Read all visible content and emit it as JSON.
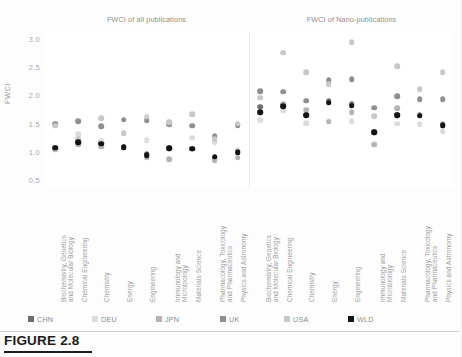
{
  "figure": {
    "caption": "FIGURE 2.8",
    "axis_title": "FWCI"
  },
  "panels": [
    {
      "id": "all",
      "title": "FWCI of all publications"
    },
    {
      "id": "nano",
      "title": "FWCI of Nano-publications"
    }
  ],
  "legend": {
    "items": [
      {
        "label": "CHN",
        "color": "#6e6e6e"
      },
      {
        "label": "DEU",
        "color": "#dcdcdc"
      },
      {
        "label": "JPN",
        "color": "#b4b4b4"
      },
      {
        "label": "UK",
        "color": "#8f8f8f"
      },
      {
        "label": "USA",
        "color": "#c8c8c8"
      },
      {
        "label": "WLD",
        "color": "#141414"
      }
    ]
  },
  "chart_data": {
    "type": "scatter",
    "xlabel": "",
    "ylabel": "FWCI",
    "ylim": [
      0.35,
      3.15
    ],
    "yticks": [
      "0.5",
      "1.0",
      "1.5",
      "2.0",
      "2.5",
      "3.0"
    ],
    "ytick_values": [
      0.5,
      1.0,
      1.5,
      2.0,
      2.5,
      3.0
    ],
    "grid": false,
    "legend_position": "bottom",
    "categories": [
      "Biochemistry, Genetics\nand Molecular Biology",
      "Chemical Engineering",
      "Chemistry",
      "Energy",
      "Engineering",
      "Immunology and\nMicrobiology",
      "Materials Science",
      "Pharmacology, Toxicology\nand Pharmaceutics",
      "Physics and Astronomy"
    ],
    "panels": [
      {
        "name": "FWCI of all publications",
        "series": [
          {
            "name": "CHN",
            "color": "#6e6e6e",
            "values": [
              1.06,
              1.17,
              1.15,
              1.08,
              0.95,
              1.06,
              1.05,
              0.88,
              0.99
            ]
          },
          {
            "name": "DEU",
            "color": "#dcdcdc",
            "values": [
              1.48,
              1.31,
              1.19,
              1.33,
              1.2,
              1.52,
              1.25,
              1.17,
              1.02
            ]
          },
          {
            "name": "JPN",
            "color": "#b4b4b4",
            "values": [
              1.04,
              1.13,
              1.09,
              1.08,
              0.89,
              0.86,
              1.05,
              0.85,
              0.89
            ]
          },
          {
            "name": "UK",
            "color": "#8f8f8f",
            "values": [
              1.5,
              1.54,
              1.45,
              1.57,
              1.56,
              1.49,
              1.46,
              1.27,
              1.47
            ]
          },
          {
            "name": "USA",
            "color": "#c8c8c8",
            "values": [
              1.46,
              1.22,
              1.59,
              1.33,
              1.62,
              1.52,
              1.67,
              1.22,
              1.5
            ]
          },
          {
            "name": "WLD",
            "color": "#141414",
            "values": [
              1.07,
              1.17,
              1.14,
              1.08,
              0.94,
              1.06,
              1.05,
              0.91,
              0.99
            ]
          }
        ]
      },
      {
        "name": "FWCI of Nano-publications",
        "series": [
          {
            "name": "CHN",
            "color": "#6e6e6e",
            "values": [
              1.8,
              1.82,
              1.66,
              1.9,
              1.84,
              1.35,
              1.66,
              1.66,
              1.46
            ]
          },
          {
            "name": "DEU",
            "color": "#dcdcdc",
            "values": [
              1.56,
              1.74,
              1.51,
              1.55,
              1.54,
              1.14,
              1.5,
              1.49,
              1.36
            ]
          },
          {
            "name": "JPN",
            "color": "#b4b4b4",
            "values": [
              1.7,
              1.85,
              1.75,
              1.53,
              1.7,
              1.12,
              1.77,
              1.64,
              1.5
            ]
          },
          {
            "name": "UK",
            "color": "#8f8f8f",
            "values": [
              2.08,
              2.07,
              1.91,
              2.27,
              2.29,
              1.78,
              1.99,
              1.93,
              1.93
            ]
          },
          {
            "name": "USA",
            "color": "#c8c8c8",
            "values": [
              1.96,
              2.76,
              2.42,
              2.2,
              2.95,
              1.63,
              2.52,
              2.11,
              2.41
            ]
          },
          {
            "name": "WLD",
            "color": "#141414",
            "values": [
              1.7,
              1.81,
              1.65,
              1.87,
              1.82,
              1.35,
              1.65,
              1.64,
              1.47
            ]
          }
        ]
      }
    ]
  }
}
